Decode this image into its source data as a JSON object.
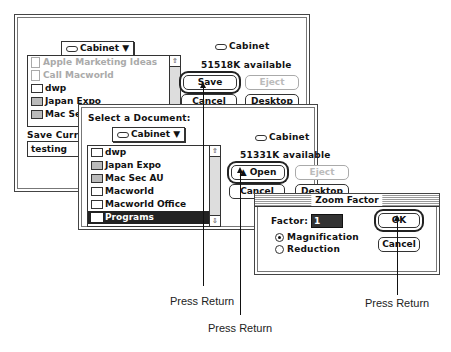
{
  "save_dialog": {
    "popup_label": "Cabinet",
    "disk_label": "Cabinet",
    "available": "51518K available",
    "files": [
      {
        "name": "Apple Marketing Ideas",
        "type": "document",
        "dimmed": true
      },
      {
        "name": "Call Macworld",
        "type": "document",
        "dimmed": true
      },
      {
        "name": "dwp",
        "type": "folder"
      },
      {
        "name": "Japan Expo",
        "type": "folder-gray"
      },
      {
        "name": "Mac Sec",
        "type": "folder-gray"
      }
    ],
    "buttons": {
      "save": "Save",
      "eject": "Eject",
      "cancel": "Cancel",
      "desktop": "Desktop"
    },
    "prompt": "Save Curren",
    "filename": "testing"
  },
  "open_dialog": {
    "prompt": "Select a Document:",
    "popup_label": "Cabinet",
    "disk_label": "Cabinet",
    "available": "51331K available",
    "files": [
      {
        "name": "dwp",
        "type": "folder"
      },
      {
        "name": "Japan Expo",
        "type": "folder-gray"
      },
      {
        "name": "Mac Sec AU",
        "type": "folder-gray"
      },
      {
        "name": "Macworld",
        "type": "folder"
      },
      {
        "name": "Macworld Office",
        "type": "folder"
      },
      {
        "name": "Programs",
        "type": "folder",
        "selected": true
      }
    ],
    "buttons": {
      "open": "Open",
      "eject": "Eject",
      "cancel": "Cancel",
      "desktop": "Desktop"
    }
  },
  "zoom_dialog": {
    "title": "Zoom Factor",
    "factor_label": "Factor:",
    "factor_value": "1",
    "options": [
      {
        "label": "Magnification",
        "selected": true
      },
      {
        "label": "Reduction",
        "selected": false
      }
    ],
    "buttons": {
      "ok": "OK",
      "cancel": "Cancel"
    }
  },
  "captions": {
    "save": "Press Return",
    "open": "Press Return",
    "ok": "Press Return"
  }
}
